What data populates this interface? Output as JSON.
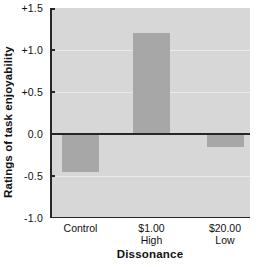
{
  "chart_data": {
    "type": "bar",
    "title": "",
    "xlabel": "Dissonance",
    "ylabel": "Ratings of task enjoyability",
    "ylim": [
      -1.0,
      1.5
    ],
    "grid": true,
    "legend": false,
    "categories": [
      {
        "lines": [
          "Control"
        ]
      },
      {
        "lines": [
          "$1.00",
          "High"
        ]
      },
      {
        "lines": [
          "$20.00",
          "Low"
        ]
      }
    ],
    "values": [
      -0.45,
      1.2,
      -0.15
    ],
    "yticks": [
      {
        "value": 1.5,
        "label": "+1.5"
      },
      {
        "value": 1.0,
        "label": "+1.0"
      },
      {
        "value": 0.5,
        "label": "+0.5"
      },
      {
        "value": 0.0,
        "label": "0.0"
      },
      {
        "value": -0.5,
        "label": "-0.5"
      },
      {
        "value": -1.0,
        "label": "-1.0"
      }
    ],
    "colors": {
      "plot_background": "#d7d7d7",
      "bar": "#a7a7a7",
      "axis": "#262626",
      "gridline": "#eaeaea",
      "text": "#111111"
    }
  }
}
